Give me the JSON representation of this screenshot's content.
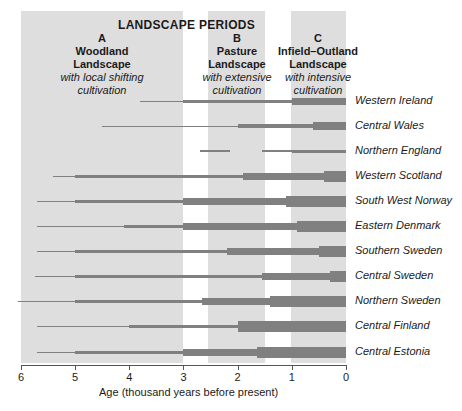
{
  "chart_data": {
    "type": "bar",
    "subtype": "horizontal timeline bars with varying thickness (intensity)",
    "title": "LANDSCAPE PERIODS",
    "xlabel": "Age (thousand years before present)",
    "ylabel": "",
    "xlim": [
      6,
      0
    ],
    "x_ticks": [
      6,
      5,
      4,
      3,
      2,
      1,
      0
    ],
    "grid": false,
    "periods": [
      {
        "letter": "A",
        "name_line1": "Woodland",
        "name_line2": "Landscape",
        "desc_line1": "with local shifting",
        "desc_line2": "cultivation",
        "start": 6.0,
        "end": 3.0
      },
      {
        "letter": "B",
        "name_line1": "Pasture",
        "name_line2": "Landscape",
        "desc_line1": "with extensive",
        "desc_line2": "cultivation",
        "start": 2.55,
        "end": 1.5
      },
      {
        "letter": "C",
        "name_line1": "Infield–Outland",
        "name_line2": "Landscape",
        "desc_line1": "with intensive",
        "desc_line2": "cultivation",
        "start": 1.02,
        "end": 0.0
      }
    ],
    "categories": [
      "Western Ireland",
      "Central Wales",
      "Northern England",
      "Western Scotland",
      "South West Norway",
      "Eastern Denmark",
      "Southern Sweden",
      "Central Sweden",
      "Northern Sweden",
      "Central Finland",
      "Central Estonia"
    ],
    "series": [
      {
        "name": "Western Ireland",
        "segments": [
          [
            3.8,
            3.0,
            1
          ],
          [
            3.0,
            1.0,
            3
          ],
          [
            1.0,
            0,
            7
          ]
        ]
      },
      {
        "name": "Central Wales",
        "segments": [
          [
            4.5,
            2.0,
            1
          ],
          [
            2.0,
            0.6,
            4
          ],
          [
            0.6,
            0,
            8
          ]
        ]
      },
      {
        "name": "Northern England",
        "segments": [
          [
            2.7,
            2.15,
            2
          ],
          [
            1.55,
            1.0,
            1.5
          ],
          [
            1.0,
            0,
            3
          ]
        ]
      },
      {
        "name": "Western Scotland",
        "segments": [
          [
            5.4,
            5.0,
            1
          ],
          [
            5.0,
            1.9,
            3
          ],
          [
            1.9,
            0.4,
            7
          ],
          [
            0.4,
            0,
            11
          ]
        ]
      },
      {
        "name": "South West Norway",
        "segments": [
          [
            5.7,
            5.0,
            1
          ],
          [
            5.0,
            3.0,
            3
          ],
          [
            3.0,
            1.1,
            7
          ],
          [
            1.1,
            0,
            11
          ]
        ]
      },
      {
        "name": "Eastern Denmark",
        "segments": [
          [
            5.7,
            4.1,
            1
          ],
          [
            4.1,
            3.0,
            3
          ],
          [
            3.0,
            0.9,
            7
          ],
          [
            0.9,
            0,
            11
          ]
        ]
      },
      {
        "name": "Southern Sweden",
        "segments": [
          [
            5.7,
            5.0,
            1
          ],
          [
            5.0,
            2.2,
            3
          ],
          [
            2.2,
            0.5,
            7
          ],
          [
            0.5,
            0,
            11
          ]
        ]
      },
      {
        "name": "Central Sweden",
        "segments": [
          [
            5.75,
            5.0,
            1
          ],
          [
            5.0,
            1.55,
            3
          ],
          [
            1.55,
            0.3,
            7
          ],
          [
            0.3,
            0,
            11
          ]
        ]
      },
      {
        "name": "Northern Sweden",
        "segments": [
          [
            6.05,
            5.0,
            1
          ],
          [
            5.0,
            2.65,
            3
          ],
          [
            2.65,
            1.4,
            7
          ],
          [
            1.4,
            0,
            11
          ]
        ]
      },
      {
        "name": "Central Finland",
        "segments": [
          [
            5.7,
            4.0,
            1
          ],
          [
            4.0,
            2.0,
            3
          ],
          [
            2.0,
            0,
            11
          ]
        ]
      },
      {
        "name": "Central Estonia",
        "segments": [
          [
            5.7,
            5.0,
            1
          ],
          [
            5.0,
            3.0,
            3
          ],
          [
            3.0,
            1.65,
            7
          ],
          [
            1.65,
            0,
            11
          ]
        ]
      }
    ],
    "segment_format": "[start_kyr_BP, end_kyr_BP, relative_thickness]",
    "colors": {
      "band": "#dedede",
      "bar": "#808080",
      "text": "#1a1a1a"
    }
  }
}
